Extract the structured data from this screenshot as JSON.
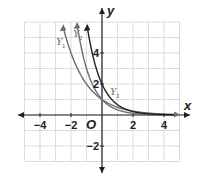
{
  "chart_data": {
    "type": "line",
    "title": "",
    "xlabel": "x",
    "ylabel": "y",
    "xlim": [
      -5,
      5
    ],
    "ylim": [
      -3,
      6
    ],
    "grid": true,
    "origin_label": "O",
    "x_ticks": [
      {
        "value": -4,
        "label": "−4"
      },
      {
        "value": -2,
        "label": "−2"
      },
      {
        "value": 2,
        "label": "2"
      },
      {
        "value": 4,
        "label": "4"
      }
    ],
    "y_ticks": [
      {
        "value": 4,
        "label": "4"
      },
      {
        "value": 2,
        "label": "2"
      },
      {
        "value": -2,
        "label": "−2"
      }
    ],
    "series": [
      {
        "name": "Y1",
        "label_main": "Y",
        "label_sub": "1",
        "formula": "(1/2)^x",
        "color": "#6d6e71",
        "points": [
          [
            -2.5,
            5.66
          ],
          [
            -2,
            4
          ],
          [
            -1,
            2
          ],
          [
            0,
            1
          ],
          [
            1,
            0.5
          ],
          [
            2,
            0.25
          ],
          [
            3,
            0.125
          ],
          [
            4,
            0.0625
          ],
          [
            4.8,
            0.036
          ]
        ]
      },
      {
        "name": "Y2",
        "label_main": "Y",
        "label_sub": "2",
        "formula": "(1/3)^x",
        "color": "#6d6e71",
        "points": [
          [
            -1.6,
            5.8
          ],
          [
            -1,
            3
          ],
          [
            0,
            1
          ],
          [
            1,
            0.333
          ],
          [
            2,
            0.111
          ],
          [
            3,
            0.037
          ],
          [
            4,
            0.012
          ],
          [
            4.8,
            0.005
          ]
        ]
      },
      {
        "name": "Y3",
        "label_main": "Y",
        "label_sub": "3",
        "formula": "2(1/3)^x",
        "color": "#231f20",
        "points": [
          [
            -0.95,
            5.65
          ],
          [
            0,
            2
          ],
          [
            1,
            0.667
          ],
          [
            2,
            0.222
          ],
          [
            3,
            0.074
          ],
          [
            4,
            0.025
          ],
          [
            4.8,
            0.01
          ]
        ]
      }
    ]
  }
}
